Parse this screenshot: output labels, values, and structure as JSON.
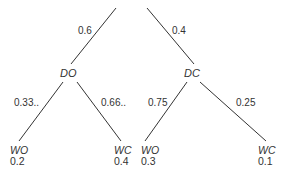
{
  "diagram": {
    "type": "probability-tree",
    "line_color": "#333333",
    "root_edges": [
      {
        "label": "0.6",
        "to": "DO"
      },
      {
        "label": "0.4",
        "to": "DC"
      }
    ],
    "nodes": {
      "do": {
        "name": "DO"
      },
      "dc": {
        "name": "DC"
      }
    },
    "branches": {
      "do_left": {
        "label": "0.33..",
        "leaf": "WO"
      },
      "do_right": {
        "label": "0.66..",
        "leaf": "WC"
      },
      "dc_left": {
        "label": "0.75",
        "leaf": "WO"
      },
      "dc_right": {
        "label": "0.25",
        "leaf": "WC"
      }
    },
    "leaves": [
      {
        "name": "WO",
        "value": "0.2"
      },
      {
        "name": "WC",
        "value": "0.4"
      },
      {
        "name": "WO",
        "value": "0.3"
      },
      {
        "name": "WC",
        "value": "0.1"
      }
    ]
  }
}
